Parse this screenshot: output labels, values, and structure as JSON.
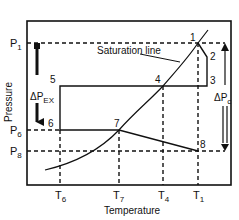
{
  "diagram": {
    "title": "",
    "xlabel": "Temperature",
    "ylabel": "Pressure",
    "curve_label": "Saturation line",
    "y_ticks": [
      {
        "main": "P",
        "sub": "1"
      },
      {
        "main": "P",
        "sub": "6"
      },
      {
        "main": "P",
        "sub": "8"
      }
    ],
    "x_ticks": [
      {
        "main": "T",
        "sub": "6"
      },
      {
        "main": "T",
        "sub": "7"
      },
      {
        "main": "T",
        "sub": "4"
      },
      {
        "main": "T",
        "sub": "1"
      }
    ],
    "points": [
      "1",
      "2",
      "3",
      "4",
      "5",
      "6",
      "7",
      "8"
    ],
    "delta_left": {
      "main": "ΔP",
      "sub": "EX"
    },
    "delta_right": {
      "main": "ΔP",
      "sub": "c"
    },
    "colors": {
      "line": "#111111",
      "background": "#ffffff"
    }
  }
}
